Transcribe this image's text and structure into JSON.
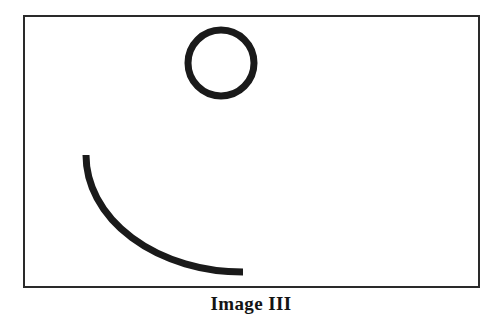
{
  "figure": {
    "caption": "Image III",
    "background_color": "#ffffff",
    "ink_color": "#1a1a1a",
    "frame": {
      "name": "frame-rectangle",
      "x": 23,
      "y": 15,
      "width": 457,
      "height": 273,
      "stroke_color": "#2a2a2a",
      "stroke_width": 2,
      "fill": "none"
    },
    "shapes": [
      {
        "name": "circle-outline",
        "type": "circle",
        "center_x": 221,
        "center_y": 63,
        "radius": 33,
        "stroke_color": "#1a1a1a",
        "stroke_width": 7,
        "fill": "none"
      },
      {
        "name": "concave-arc",
        "type": "arc",
        "start_x": 86,
        "start_y": 155,
        "end_x": 243,
        "end_y": 272,
        "radius_x": 157,
        "radius_y": 117,
        "sweep": "concave-up",
        "stroke_color": "#1a1a1a",
        "stroke_width": 7,
        "stroke_linecap": "butt",
        "fill": "none"
      }
    ]
  }
}
